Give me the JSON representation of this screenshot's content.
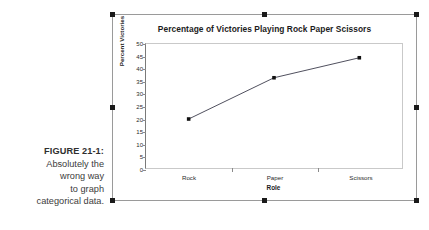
{
  "caption": {
    "figure_number": "FIGURE 21-1:",
    "lines": [
      "Absolutely the",
      "wrong way",
      "to graph",
      "categorical data."
    ]
  },
  "figure": {
    "selected": true,
    "handle_names": [
      "handle-top-left",
      "handle-top-center",
      "handle-top-right",
      "handle-middle-left",
      "handle-middle-right",
      "handle-bottom-left",
      "handle-bottom-center",
      "handle-bottom-right"
    ],
    "frame_color": "#9a9a9a",
    "handle_color": "#1a1a1a"
  },
  "chart_data": {
    "type": "line",
    "title": "Percentage of Victories Playing Rock Paper Scissors",
    "xlabel": "Role",
    "ylabel": "Percent Victories",
    "categories": [
      "Rock",
      "Paper",
      "Scissors"
    ],
    "values": [
      20,
      36.5,
      44.5
    ],
    "series": [
      {
        "name": "Percent Victories",
        "values": [
          20,
          36.5,
          44.5
        ]
      }
    ],
    "ylim": [
      0,
      50
    ],
    "ytick_step": 5,
    "ytick_labels": [
      "0",
      "5",
      "10",
      "15",
      "20",
      "25",
      "30",
      "35",
      "40",
      "45",
      "50"
    ],
    "grid": false,
    "legend": "none",
    "line_color": "#3a3a4a",
    "marker": "square",
    "marker_color": "#111111",
    "plot_border_color": "#c9c9c9",
    "axis_color": "#7a7a7a"
  }
}
